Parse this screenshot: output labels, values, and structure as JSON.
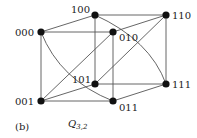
{
  "figure": {
    "panel_label": "(b)",
    "title_main": "Q",
    "title_sub": "3,2"
  },
  "colors": {
    "edge": "#555555",
    "node": "#111111",
    "text": "#222222"
  },
  "nodes": [
    {
      "id": "000",
      "label": "000",
      "x": 41,
      "y": 32,
      "lx": 15,
      "ly": 36
    },
    {
      "id": "100",
      "label": "100",
      "x": 95,
      "y": 15,
      "lx": 71,
      "ly": 13
    },
    {
      "id": "010",
      "label": "010",
      "x": 113,
      "y": 32,
      "lx": 119,
      "ly": 41
    },
    {
      "id": "110",
      "label": "110",
      "x": 166,
      "y": 15,
      "lx": 172,
      "ly": 19
    },
    {
      "id": "101",
      "label": "101",
      "x": 95,
      "y": 84,
      "lx": 72,
      "ly": 83
    },
    {
      "id": "111",
      "label": "111",
      "x": 166,
      "y": 84,
      "lx": 172,
      "ly": 88
    },
    {
      "id": "001",
      "label": "001",
      "x": 41,
      "y": 101,
      "lx": 15,
      "ly": 105
    },
    {
      "id": "011",
      "label": "011",
      "x": 113,
      "y": 101,
      "lx": 119,
      "ly": 111
    }
  ],
  "edges": [
    [
      "000",
      "100"
    ],
    [
      "000",
      "010"
    ],
    [
      "000",
      "001"
    ],
    [
      "100",
      "110"
    ],
    [
      "100",
      "101"
    ],
    [
      "010",
      "110"
    ],
    [
      "010",
      "011"
    ],
    [
      "010",
      "001"
    ],
    [
      "110",
      "111"
    ],
    [
      "110",
      "101"
    ],
    [
      "101",
      "111"
    ],
    [
      "101",
      "001"
    ],
    [
      "001",
      "011"
    ],
    [
      "011",
      "111"
    ]
  ],
  "curved_edges": [
    {
      "from": "000",
      "to": "011",
      "cx": 60,
      "cy": 80
    },
    {
      "from": "100",
      "to": "111",
      "cx": 150,
      "cy": 40
    }
  ]
}
